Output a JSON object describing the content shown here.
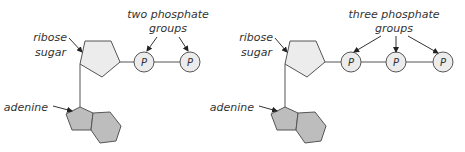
{
  "colors": {
    "ribose_fill": "#ececec",
    "adenine_fill": "#bdbdbd",
    "phosphate_fill": "#ececec",
    "stroke": "#555555",
    "text": "#333333"
  },
  "diagrams": [
    {
      "name": "ADP",
      "labels": {
        "ribose_line1": "ribose",
        "ribose_line2": "sugar",
        "adenine": "adenine",
        "phosphate_line1": "two phosphate",
        "phosphate_line2": "groups"
      },
      "phosphates": [
        "P",
        "P"
      ]
    },
    {
      "name": "ATP",
      "labels": {
        "ribose_line1": "ribose",
        "ribose_line2": "sugar",
        "adenine": "adenine",
        "phosphate_line1": "three phosphate",
        "phosphate_line2": "groups"
      },
      "phosphates": [
        "P",
        "P",
        "P"
      ]
    }
  ]
}
